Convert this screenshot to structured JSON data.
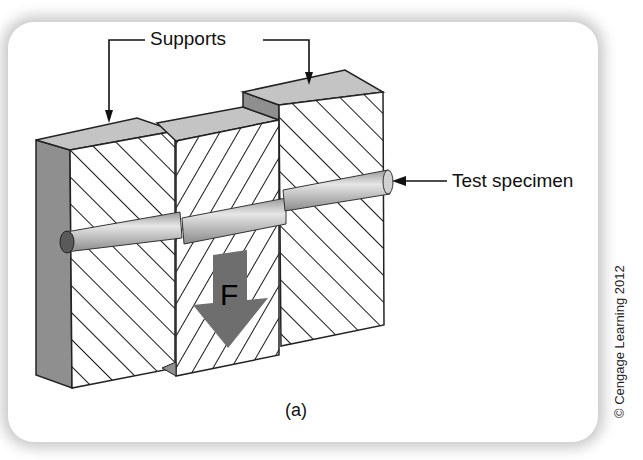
{
  "figure": {
    "labels": {
      "supports": "Supports",
      "test_specimen": "Test specimen",
      "force": "F",
      "caption": "(a)"
    },
    "credit": "© Cengage Learning 2012",
    "colors": {
      "block_top": "#c4c4c4",
      "block_side": "#8f8f8f",
      "hatch": "#1a1a1a",
      "rod": "#bdbdbd",
      "arrow": "#6e6e6e",
      "frame_shadow": "#bfbfbf"
    }
  }
}
